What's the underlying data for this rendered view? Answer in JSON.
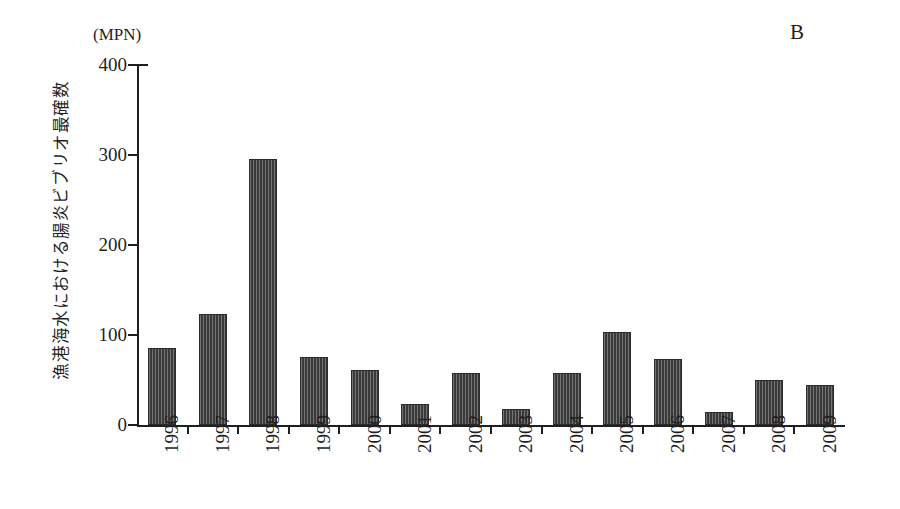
{
  "figure": {
    "panel_label": "B",
    "y_unit_caption": "(MPN)",
    "y_axis_title": "漁港海水における腸炎ビブリオ最確数",
    "bar_color": "#3a3a3a",
    "axis_color": "#1f1f1f",
    "background_color": "#ffffff"
  },
  "chart_data": {
    "type": "bar",
    "title": "B",
    "xlabel": "",
    "ylabel": "漁港海水における腸炎ビブリオ最確数",
    "yunit": "(MPN)",
    "ylim": [
      0,
      400
    ],
    "yticks": [
      0,
      100,
      200,
      300,
      400
    ],
    "ytick_labels": [
      "0",
      "100",
      "200",
      "300",
      "400"
    ],
    "grid": false,
    "legend": false,
    "categories": [
      "1996",
      "1997",
      "1998",
      "1999",
      "2000",
      "2001",
      "2002",
      "2003",
      "2004",
      "2005",
      "2006",
      "2007",
      "2008",
      "2009"
    ],
    "values": [
      86,
      123,
      296,
      76,
      61,
      23,
      58,
      18,
      58,
      103,
      73,
      15,
      50,
      44
    ]
  }
}
